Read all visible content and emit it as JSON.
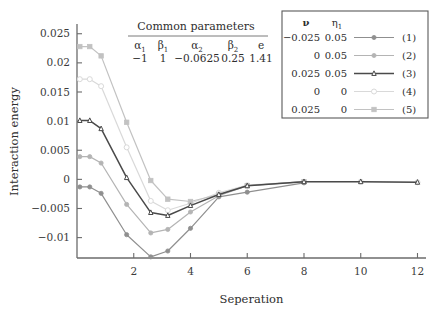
{
  "chart_data": {
    "type": "line",
    "title": "",
    "xlabel": "Seperation",
    "ylabel": "Interaction energy",
    "xlim": [
      0,
      12.3
    ],
    "ylim": [
      -0.0135,
      0.0265
    ],
    "xticks": [
      2,
      4,
      6,
      8,
      10,
      12
    ],
    "yticks": [
      -0.01,
      -0.005,
      0,
      0.005,
      0.01,
      0.015,
      0.02,
      0.025
    ],
    "ytick_labels": [
      "−0.01",
      "−0.005",
      "0",
      "0.005",
      "0.01",
      "0.015",
      "0.02",
      "0.025"
    ],
    "xtick_labels": [
      "2",
      "4",
      "6",
      "8",
      "10",
      "12"
    ],
    "grid": false,
    "legend_position": "upper right",
    "series": [
      {
        "name": "(1)",
        "label": "(1)",
        "nu": "−0.025",
        "eta1": "0.05",
        "color": "#8f8f8f",
        "marker": "circle",
        "marker_fill": "#8f8f8f",
        "x": [
          0.1,
          0.45,
          0.85,
          1.75,
          2.6,
          3.2,
          4.0,
          5.0,
          6.0,
          8.0
        ],
        "y": [
          -0.0013,
          -0.0013,
          -0.0024,
          -0.0095,
          -0.0133,
          -0.0123,
          -0.0084,
          -0.003,
          -0.0022,
          -0.0006
        ]
      },
      {
        "name": "(2)",
        "label": "(2)",
        "nu": "0",
        "eta1": "0.05",
        "color": "#b4b4b4",
        "marker": "circle",
        "marker_fill": "#b4b4b4",
        "x": [
          0.1,
          0.45,
          0.85,
          1.75,
          2.6,
          3.2,
          4.0,
          5.0,
          6.0,
          8.0
        ],
        "y": [
          0.0039,
          0.0039,
          0.0028,
          -0.0043,
          -0.0092,
          -0.0086,
          -0.0056,
          -0.0028,
          -0.0011,
          -0.0004
        ]
      },
      {
        "name": "(3)",
        "label": "(3)",
        "nu": "0.025",
        "eta1": "0.05",
        "color": "#4a4a4a",
        "marker": "triangle-open",
        "marker_fill": "#ffffff",
        "x": [
          0.1,
          0.45,
          0.85,
          1.75,
          2.6,
          3.2,
          4.0,
          5.0,
          6.0,
          8.0,
          10.0,
          12.0
        ],
        "y": [
          0.0101,
          0.0101,
          0.0087,
          0.0003,
          -0.0057,
          -0.0062,
          -0.0045,
          -0.0026,
          -0.0011,
          -0.0004,
          -0.0004,
          -0.0005
        ]
      },
      {
        "name": "(4)",
        "label": "(4)",
        "nu": "0",
        "eta1": "0",
        "color": "#d9d9d9",
        "marker": "circle-open",
        "marker_fill": "#ffffff",
        "x": [
          0.1,
          0.45,
          0.85,
          1.75,
          2.6,
          3.2,
          4.0,
          5.0,
          6.0,
          8.0,
          10.0,
          12.0
        ],
        "y": [
          0.0172,
          0.0172,
          0.016,
          0.0055,
          -0.0037,
          -0.0053,
          -0.0041,
          -0.0023,
          -0.001,
          -0.0004,
          -0.0004,
          -0.0005
        ]
      },
      {
        "name": "(5)",
        "label": "(5)",
        "nu": "0.025",
        "eta1": "0",
        "color": "#c2c2c2",
        "marker": "square",
        "marker_fill": "#c2c2c2",
        "x": [
          0.1,
          0.45,
          0.85,
          1.75,
          2.6,
          3.2,
          4.0,
          5.0,
          6.0,
          8.0
        ],
        "y": [
          0.0228,
          0.0228,
          0.0212,
          0.0098,
          -0.0002,
          -0.0034,
          -0.0038,
          -0.0026,
          -0.0011,
          -0.0004
        ]
      }
    ]
  },
  "params_table": {
    "title": "Common parameters",
    "headers": [
      "α",
      "β",
      "α",
      "β",
      "e"
    ],
    "header_subs": [
      "1",
      "1",
      "2",
      "2",
      ""
    ],
    "values": [
      "−1",
      "1",
      "−0.0625",
      "0.25",
      "1.41"
    ]
  },
  "legend": {
    "header_nu": "ν",
    "header_eta": "η",
    "header_eta_sub": "1",
    "rows": [
      {
        "nu": "−0.025",
        "eta1": "0.05",
        "label": "(1)"
      },
      {
        "nu": "0",
        "eta1": "0.05",
        "label": "(2)"
      },
      {
        "nu": "0.025",
        "eta1": "0.05",
        "label": "(3)"
      },
      {
        "nu": "0",
        "eta1": "0",
        "label": "(4)"
      },
      {
        "nu": "0.025",
        "eta1": "0",
        "label": "(5)"
      }
    ]
  },
  "axes": {
    "x_title": "Seperation",
    "y_title": "Interaction energy"
  }
}
